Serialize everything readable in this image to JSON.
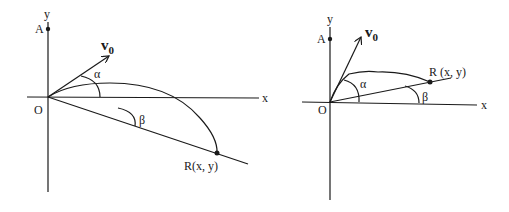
{
  "diagrams": [
    {
      "id": "left",
      "description": "Projectile launched from O at angle alpha landing on downward incline of angle beta",
      "labels": {
        "y_axis": "y",
        "x_axis": "x",
        "point_a": "A",
        "origin": "O",
        "velocity": "v",
        "velocity_sub": "0",
        "alpha": "α",
        "beta": "β",
        "landing_point": "R(x, y)"
      }
    },
    {
      "id": "right",
      "description": "Projectile launched from O at angle alpha landing on upward incline of angle beta",
      "labels": {
        "y_axis": "y",
        "x_axis": "x",
        "point_a": "A",
        "origin": "O",
        "velocity": "v",
        "velocity_sub": "0",
        "alpha": "α",
        "beta": "β",
        "landing_point": "R (x, y)"
      }
    }
  ]
}
